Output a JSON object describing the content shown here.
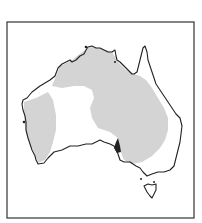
{
  "map": {
    "subject": "Australia",
    "frame": {
      "x": 7,
      "y": 22,
      "width": 187,
      "height": 196,
      "stroke": "#333333"
    },
    "colors": {
      "background": "#ffffff",
      "land": "#ffffff",
      "coastline": "#222222",
      "shaded_region": "#d4d4d4"
    },
    "regions": [
      {
        "name": "western-shaded-region"
      },
      {
        "name": "northern-eastern-shaded-region"
      }
    ],
    "features": [
      "mainland",
      "tasmania"
    ]
  }
}
